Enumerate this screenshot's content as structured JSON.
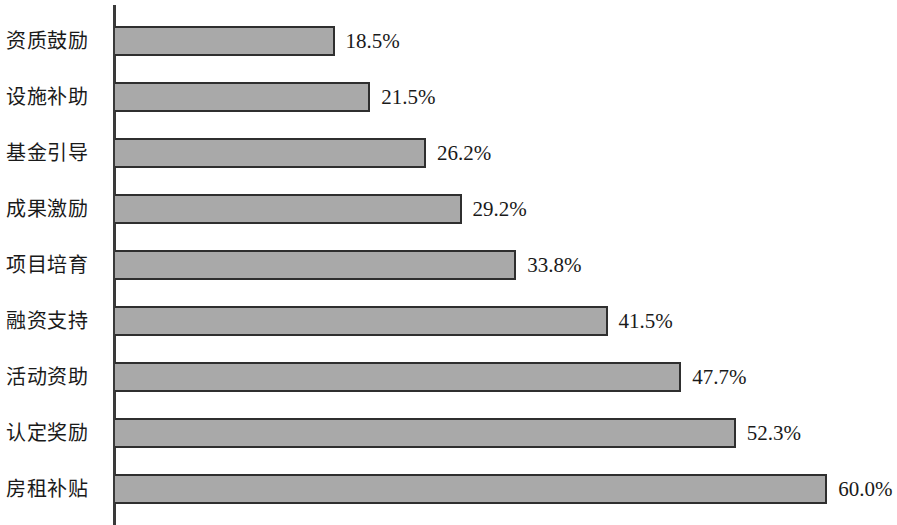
{
  "chart_data": {
    "type": "bar",
    "orientation": "horizontal",
    "title": "",
    "subtitle": "",
    "xlabel": "",
    "ylabel": "",
    "categories": [
      "资质鼓励",
      "设施补助",
      "基金引导",
      "成果激励",
      "项目培育",
      "融资支持",
      "活动资助",
      "认定奖励",
      "房租补贴"
    ],
    "values": [
      18.5,
      21.5,
      26.2,
      29.2,
      33.8,
      41.5,
      47.7,
      52.3,
      60.0
    ],
    "value_labels": [
      "18.5%",
      "21.5%",
      "26.2%",
      "29.2%",
      "33.8%",
      "41.5%",
      "47.7%",
      "52.3%",
      "60.0%"
    ],
    "xlim": [
      0,
      60
    ],
    "grid": false,
    "legend": null,
    "legend_position": "none",
    "annotations": [],
    "bar_fill_color": "#a9a9a9",
    "bar_border_color": "#2f2f2f",
    "axis_color": "#3a3a3a",
    "background_color": "#ffffff",
    "text_color": "#1a1a1a"
  },
  "rows": [
    {
      "label": "资质鼓励",
      "value": 18.5,
      "value_label": "18.5%"
    },
    {
      "label": "设施补助",
      "value": 21.5,
      "value_label": "21.5%"
    },
    {
      "label": "基金引导",
      "value": 26.2,
      "value_label": "26.2%"
    },
    {
      "label": "成果激励",
      "value": 29.2,
      "value_label": "29.2%"
    },
    {
      "label": "项目培育",
      "value": 33.8,
      "value_label": "33.8%"
    },
    {
      "label": "融资支持",
      "value": 41.5,
      "value_label": "41.5%"
    },
    {
      "label": "活动资助",
      "value": 47.7,
      "value_label": "47.7%"
    },
    {
      "label": "认定奖励",
      "value": 52.3,
      "value_label": "52.3%"
    },
    {
      "label": "房租补贴",
      "value": 60.0,
      "value_label": "60.0%"
    }
  ]
}
